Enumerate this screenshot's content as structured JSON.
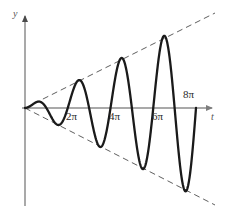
{
  "figure": {
    "background_color": "#ffffff",
    "axis_color": "#8a8a8a",
    "curve_color": "#1a1a1a",
    "envelope_color": "#4d4d4d",
    "label_color": "#2b2b2b"
  },
  "axes": {
    "y_axis_label": "y",
    "x_axis_label": "t",
    "origin_px": [
      25,
      108
    ],
    "x_axis_tip_px": [
      217,
      108
    ],
    "y_axis_tip_px": [
      25,
      13
    ],
    "y_axis_bottom_px": [
      25,
      206
    ]
  },
  "ticks": {
    "x": [
      {
        "label": "2π",
        "value": 6.283
      },
      {
        "label": "4π",
        "value": 12.566
      },
      {
        "label": "6π",
        "value": 18.85
      },
      {
        "label": "8π",
        "value": 25.133
      }
    ]
  },
  "chart_data": {
    "type": "line",
    "title": "",
    "subtitle": "",
    "xlabel": "t",
    "ylabel": "y",
    "xlim": [
      0,
      27.0
    ],
    "ylim": [
      -4.6,
      4.6
    ],
    "grid": false,
    "legend": false,
    "legend_position": "none",
    "x_tick_values": [
      6.283,
      12.566,
      18.85,
      25.133
    ],
    "x_tick_labels": [
      "2π",
      "4π",
      "6π",
      "8π"
    ],
    "y_tick_values": [],
    "y_tick_labels": [],
    "series": [
      {
        "name": "y = k·t·sin(t)",
        "style": "solid",
        "color": "#1a1a1a",
        "linewidth": 2.4,
        "formula": "y = 0.176 * t * sin(t)",
        "t_start": 0,
        "t_end": 25.133,
        "samples_hint": 600,
        "key_points": [
          {
            "t": 0.0,
            "y": 0.0,
            "kind": "origin-crossing"
          },
          {
            "t": 2.03,
            "y": 0.32,
            "kind": "local-maximum"
          },
          {
            "t": 3.142,
            "y": 0.0,
            "kind": "zero-crossing"
          },
          {
            "t": 4.91,
            "y": -0.85,
            "kind": "local-minimum"
          },
          {
            "t": 6.283,
            "y": 0.0,
            "kind": "zero-crossing"
          },
          {
            "t": 7.98,
            "y": 1.39,
            "kind": "local-maximum"
          },
          {
            "t": 9.425,
            "y": 0.0,
            "kind": "zero-crossing"
          },
          {
            "t": 11.09,
            "y": -1.94,
            "kind": "local-minimum"
          },
          {
            "t": 12.566,
            "y": 0.0,
            "kind": "zero-crossing"
          },
          {
            "t": 14.21,
            "y": 2.49,
            "kind": "local-maximum"
          },
          {
            "t": 15.708,
            "y": 0.0,
            "kind": "zero-crossing"
          },
          {
            "t": 17.34,
            "y": -3.04,
            "kind": "local-minimum"
          },
          {
            "t": 18.85,
            "y": 0.0,
            "kind": "zero-crossing"
          },
          {
            "t": 20.46,
            "y": 3.59,
            "kind": "local-maximum"
          },
          {
            "t": 21.991,
            "y": 0.0,
            "kind": "zero-crossing"
          },
          {
            "t": 23.59,
            "y": -4.13,
            "kind": "local-minimum"
          },
          {
            "t": 25.133,
            "y": 0.0,
            "kind": "zero-crossing"
          }
        ]
      },
      {
        "name": "upper envelope",
        "style": "dashed",
        "color": "#4d4d4d",
        "linewidth": 1,
        "formula": "y = 0.176 * t",
        "from": {
          "t": 0.0,
          "y": 0.0
        },
        "to": {
          "t": 26.9,
          "y": 4.56
        }
      },
      {
        "name": "lower envelope",
        "style": "dashed",
        "color": "#4d4d4d",
        "linewidth": 1,
        "formula": "y = -0.176 * t",
        "from": {
          "t": 0.0,
          "y": 0.0
        },
        "to": {
          "t": 26.9,
          "y": -4.56
        }
      }
    ]
  }
}
